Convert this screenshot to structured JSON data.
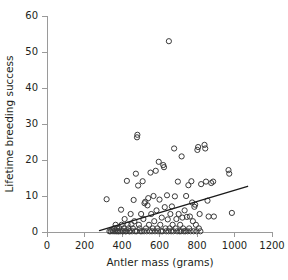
{
  "chart_data": {
    "type": "scatter",
    "title": "",
    "xlabel": "Antler mass (grams)",
    "ylabel": "Lifetime breeding success",
    "xlim": [
      0,
      1200
    ],
    "ylim": [
      0,
      60
    ],
    "xticks": [
      0,
      200,
      400,
      600,
      800,
      1000,
      1200
    ],
    "yticks": [
      0,
      10,
      20,
      30,
      40,
      50,
      60
    ],
    "grid": false,
    "legend": null,
    "marker": "open-circle",
    "marker_color": "#3a3a3a",
    "trendline": {
      "label": "linear fit",
      "x": [
        280,
        1070
      ],
      "y": [
        0.4,
        12.7
      ],
      "color": "#1a1a1a"
    },
    "series": [
      {
        "name": "red deer stags",
        "points": [
          [
            318,
            9.1
          ],
          [
            333,
            0.2
          ],
          [
            340,
            0.2
          ],
          [
            348,
            0.5
          ],
          [
            352,
            0.2
          ],
          [
            358,
            1.0
          ],
          [
            362,
            0.2
          ],
          [
            366,
            2.0
          ],
          [
            370,
            0.2
          ],
          [
            374,
            1.0
          ],
          [
            378,
            0.2
          ],
          [
            382,
            0.2
          ],
          [
            386,
            1.1
          ],
          [
            390,
            0.2
          ],
          [
            395,
            6.2
          ],
          [
            398,
            2.0
          ],
          [
            402,
            0.2
          ],
          [
            406,
            0.2
          ],
          [
            410,
            1.0
          ],
          [
            414,
            3.6
          ],
          [
            418,
            0.2
          ],
          [
            422,
            0.2
          ],
          [
            426,
            14.2
          ],
          [
            430,
            2.0
          ],
          [
            434,
            1.0
          ],
          [
            438,
            0.2
          ],
          [
            442,
            0.2
          ],
          [
            446,
            5.0
          ],
          [
            450,
            2.1
          ],
          [
            454,
            0.2
          ],
          [
            458,
            1.0
          ],
          [
            462,
            8.9
          ],
          [
            466,
            3.0
          ],
          [
            470,
            0.2
          ],
          [
            474,
            16.2
          ],
          [
            478,
            0.2
          ],
          [
            480,
            26.3
          ],
          [
            482,
            27.0
          ],
          [
            486,
            12.9
          ],
          [
            490,
            2.0
          ],
          [
            494,
            1.0
          ],
          [
            498,
            0.2
          ],
          [
            502,
            5.0
          ],
          [
            506,
            0.2
          ],
          [
            510,
            14.1
          ],
          [
            514,
            3.6
          ],
          [
            518,
            0.2
          ],
          [
            520,
            8.0
          ],
          [
            524,
            8.4
          ],
          [
            528,
            1.0
          ],
          [
            532,
            0.2
          ],
          [
            536,
            7.4
          ],
          [
            540,
            9.4
          ],
          [
            544,
            2.0
          ],
          [
            548,
            0.2
          ],
          [
            552,
            16.5
          ],
          [
            556,
            5.0
          ],
          [
            560,
            0.2
          ],
          [
            564,
            1.0
          ],
          [
            568,
            10.0
          ],
          [
            572,
            3.0
          ],
          [
            576,
            0.2
          ],
          [
            580,
            17.0
          ],
          [
            584,
            6.0
          ],
          [
            588,
            1.0
          ],
          [
            592,
            0.2
          ],
          [
            596,
            19.5
          ],
          [
            600,
            9.0
          ],
          [
            604,
            2.0
          ],
          [
            608,
            0.2
          ],
          [
            612,
            4.0
          ],
          [
            616,
            0.2
          ],
          [
            620,
            18.6
          ],
          [
            624,
            18.0
          ],
          [
            628,
            6.9
          ],
          [
            632,
            1.0
          ],
          [
            636,
            0.2
          ],
          [
            640,
            10.2
          ],
          [
            644,
            3.5
          ],
          [
            648,
            0.2
          ],
          [
            650,
            53.0
          ],
          [
            654,
            1.0
          ],
          [
            658,
            5.0
          ],
          [
            662,
            0.2
          ],
          [
            666,
            7.1
          ],
          [
            670,
            2.0
          ],
          [
            674,
            0.2
          ],
          [
            678,
            23.2
          ],
          [
            682,
            9.9
          ],
          [
            686,
            1.0
          ],
          [
            690,
            3.6
          ],
          [
            694,
            0.2
          ],
          [
            698,
            14.0
          ],
          [
            702,
            5.0
          ],
          [
            706,
            0.2
          ],
          [
            710,
            2.0
          ],
          [
            714,
            0.2
          ],
          [
            718,
            21.0
          ],
          [
            722,
            4.0
          ],
          [
            726,
            1.0
          ],
          [
            730,
            0.2
          ],
          [
            734,
            6.0
          ],
          [
            738,
            0.2
          ],
          [
            742,
            10.0
          ],
          [
            746,
            4.2
          ],
          [
            750,
            0.2
          ],
          [
            754,
            13.0
          ],
          [
            758,
            1.0
          ],
          [
            762,
            4.3
          ],
          [
            766,
            0.2
          ],
          [
            770,
            14.1
          ],
          [
            774,
            8.2
          ],
          [
            778,
            3.0
          ],
          [
            782,
            0.2
          ],
          [
            786,
            7.0
          ],
          [
            790,
            7.6
          ],
          [
            794,
            2.0
          ],
          [
            798,
            0.2
          ],
          [
            802,
            22.8
          ],
          [
            806,
            23.6
          ],
          [
            810,
            1.0
          ],
          [
            814,
            5.0
          ],
          [
            818,
            0.2
          ],
          [
            822,
            13.3
          ],
          [
            840,
            24.2
          ],
          [
            844,
            23.2
          ],
          [
            848,
            14.0
          ],
          [
            856,
            8.7
          ],
          [
            862,
            4.3
          ],
          [
            876,
            13.6
          ],
          [
            886,
            14.0
          ],
          [
            890,
            4.3
          ],
          [
            968,
            17.2
          ],
          [
            972,
            16.2
          ],
          [
            986,
            5.3
          ]
        ]
      }
    ]
  },
  "axis": {
    "x_title": "Antler mass (grams)",
    "y_title": "Lifetime breeding success"
  }
}
